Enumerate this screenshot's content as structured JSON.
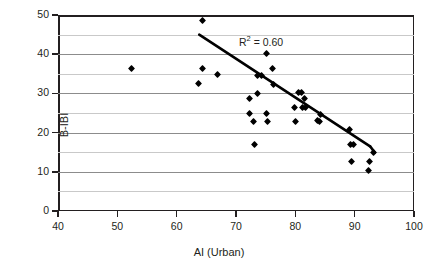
{
  "chart_data": {
    "type": "scatter",
    "title": "",
    "xlabel": "AI (Urban)",
    "ylabel": "B-IBI",
    "xlim": [
      40,
      100
    ],
    "ylim": [
      0,
      50
    ],
    "xticks": [
      40,
      50,
      60,
      70,
      80,
      90,
      100
    ],
    "yticks": [
      0,
      10,
      20,
      30,
      40,
      50
    ],
    "gridlines_y": [
      5,
      15,
      25,
      35,
      45
    ],
    "grid": "horizontal-minor",
    "legend": "none",
    "annotations": [
      {
        "name": "r-squared",
        "text_prefix": "R",
        "text_sup": "2",
        "text_suffix": " = 0.60",
        "text": "R2 = 0.60",
        "x": 70.5,
        "y": 43.0
      }
    ],
    "marker": {
      "shape": "diamond",
      "color": "#000000",
      "size_px": 5
    },
    "trendline": {
      "name": "linear-fit",
      "color": "#000000",
      "width_px": 2.6,
      "segments": [
        {
          "x1": 63.8,
          "y1": 45.0,
          "x2": 92.6,
          "y2": 16.5
        },
        {
          "x1": 92.6,
          "y1": 16.5,
          "x2": 93.4,
          "y2": 14.9
        }
      ]
    },
    "points": [
      {
        "x": 52.4,
        "y": 36.3
      },
      {
        "x": 63.6,
        "y": 32.5
      },
      {
        "x": 64.3,
        "y": 48.5
      },
      {
        "x": 64.4,
        "y": 36.3
      },
      {
        "x": 66.9,
        "y": 34.7
      },
      {
        "x": 72.2,
        "y": 28.6
      },
      {
        "x": 72.3,
        "y": 24.8
      },
      {
        "x": 72.9,
        "y": 22.8
      },
      {
        "x": 73.1,
        "y": 17.0
      },
      {
        "x": 73.6,
        "y": 30.0
      },
      {
        "x": 73.7,
        "y": 34.5
      },
      {
        "x": 74.3,
        "y": 34.5
      },
      {
        "x": 75.1,
        "y": 40.1
      },
      {
        "x": 75.2,
        "y": 24.8
      },
      {
        "x": 75.3,
        "y": 22.8
      },
      {
        "x": 76.1,
        "y": 36.3
      },
      {
        "x": 76.3,
        "y": 32.2
      },
      {
        "x": 79.9,
        "y": 26.4
      },
      {
        "x": 80.1,
        "y": 22.8
      },
      {
        "x": 80.6,
        "y": 30.2
      },
      {
        "x": 81.1,
        "y": 30.2
      },
      {
        "x": 81.2,
        "y": 26.5
      },
      {
        "x": 81.5,
        "y": 28.6
      },
      {
        "x": 81.7,
        "y": 26.5
      },
      {
        "x": 83.7,
        "y": 23.1
      },
      {
        "x": 84.0,
        "y": 22.9
      },
      {
        "x": 84.2,
        "y": 24.6
      },
      {
        "x": 89.2,
        "y": 20.8
      },
      {
        "x": 89.3,
        "y": 17.0
      },
      {
        "x": 89.4,
        "y": 12.6
      },
      {
        "x": 89.8,
        "y": 17.0
      },
      {
        "x": 92.3,
        "y": 10.3
      },
      {
        "x": 92.5,
        "y": 12.6
      },
      {
        "x": 93.2,
        "y": 14.9
      }
    ]
  }
}
